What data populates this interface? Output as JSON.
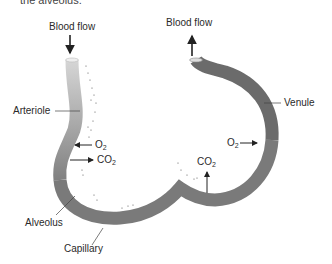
{
  "caption": "the alveolus.",
  "labels": {
    "blood_flow_in": "Blood flow",
    "blood_flow_out": "Blood flow",
    "arteriole": "Arteriole",
    "venule": "Venule",
    "alveolus": "Alveolus",
    "capillary": "Capillary",
    "o2_left": "O",
    "o2_left_sub": "2",
    "co2_left": "CO",
    "co2_left_sub": "2",
    "o2_right": "O",
    "o2_right_sub": "2",
    "co2_right": "CO",
    "co2_right_sub": "2"
  },
  "colors": {
    "arteriole_light": "#d4d4d4",
    "vessel_mid": "#8a8a8a",
    "venule_dark": "#6a6a6a",
    "arrow": "#222222"
  }
}
